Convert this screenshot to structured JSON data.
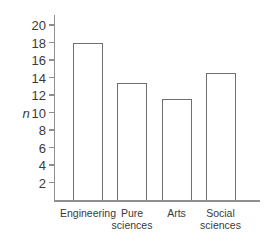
{
  "chart_data": {
    "type": "bar",
    "categories": [
      "Engineering",
      "Pure sciences",
      "Arts",
      "Social sciences"
    ],
    "values": [
      18,
      13.4,
      11.5,
      14.5
    ],
    "title": "",
    "xlabel": "",
    "ylabel": "n",
    "ylim": [
      0,
      21
    ],
    "yticks": [
      2,
      4,
      6,
      8,
      10,
      12,
      14,
      16,
      18,
      20
    ],
    "grid": false,
    "legend": false,
    "bar_fill": "#ffffff",
    "bar_border": "#6f6f6f",
    "axis_color": "#8f8f8f",
    "text_color": "#3a3a3a"
  }
}
